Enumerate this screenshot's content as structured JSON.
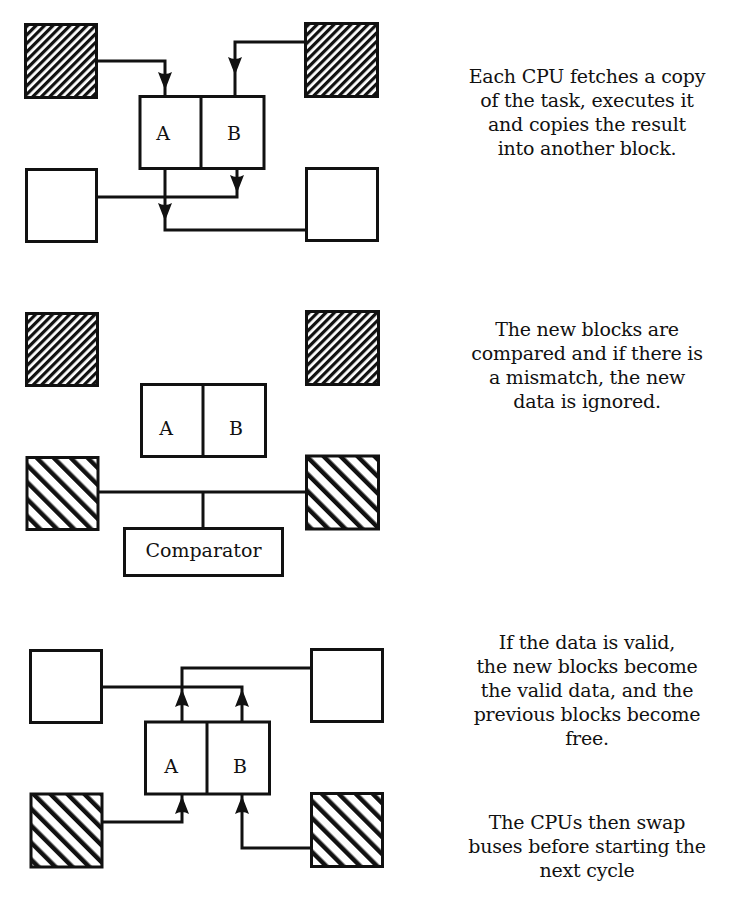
{
  "diagram": {
    "style": {
      "ink_color": "#111111",
      "background": "#ffffff"
    },
    "legend_semantics": {
      "fine_hatch": "current valid data block",
      "coarse_hatch": "new result block",
      "empty": "free block"
    },
    "panels": [
      {
        "id": "panel-1",
        "cpu_labels": [
          "A",
          "B"
        ],
        "caption_lines": [
          "Each CPU fetches a copy",
          "of the task, executes it",
          "and copies the result",
          "into another block."
        ],
        "blocks": {
          "top_left": "fine_hatch",
          "top_right": "fine_hatch",
          "bottom_left": "empty",
          "bottom_right": "empty"
        },
        "flows": [
          "top_left -> A",
          "top_right -> B",
          "B -> bottom_left",
          "A -> bottom_right"
        ]
      },
      {
        "id": "panel-2",
        "cpu_labels": [
          "A",
          "B"
        ],
        "comparator_label": "Comparator",
        "caption_lines": [
          "The new blocks are",
          "compared and if there is",
          "a mismatch, the new",
          "data is ignored."
        ],
        "blocks": {
          "top_left": "fine_hatch",
          "top_right": "fine_hatch",
          "bottom_left": "coarse_hatch",
          "bottom_right": "coarse_hatch"
        },
        "flows": [
          "bottom_left -- Comparator",
          "bottom_right -- Comparator"
        ]
      },
      {
        "id": "panel-3",
        "cpu_labels": [
          "A",
          "B"
        ],
        "caption_lines": [
          "If the data is valid,",
          "the new blocks become",
          "the valid data, and the",
          "previous blocks become",
          "free."
        ],
        "caption2_lines": [
          "The CPUs then swap",
          "buses before starting the",
          "next cycle"
        ],
        "blocks": {
          "top_left": "empty",
          "top_right": "empty",
          "bottom_left": "coarse_hatch",
          "bottom_right": "coarse_hatch"
        },
        "flows": [
          "bottom_left -> A",
          "bottom_right -> B",
          "A -> top_right",
          "B -> top_left"
        ]
      }
    ]
  }
}
